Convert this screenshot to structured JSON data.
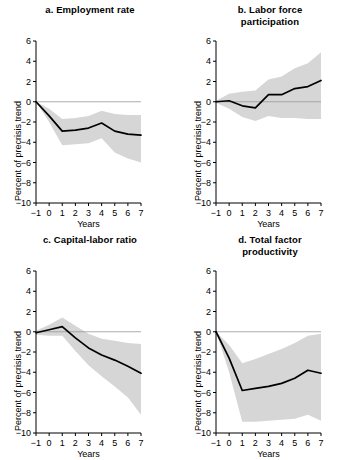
{
  "figure": {
    "background_color": "#ffffff",
    "band_color": "#d6d6d6",
    "line_color": "#000000",
    "axis_color": "#000000",
    "zeroline_color": "#999999"
  },
  "common": {
    "ylabel": "Percent of precrisis trend",
    "xlabel": "Years",
    "ylim": [
      -10,
      6
    ],
    "xlim": [
      -1,
      7
    ],
    "yticks": [
      "6",
      "4",
      "2",
      "0",
      "-2",
      "-4",
      "-6",
      "-8",
      "-10"
    ],
    "xticks": [
      "-1",
      "0",
      "1",
      "2",
      "3",
      "4",
      "5",
      "6",
      "7"
    ]
  },
  "chart_data": [
    {
      "type": "line",
      "panel": "a",
      "title": "a. Employment rate",
      "title_lines": [
        "a. Employment rate"
      ],
      "xlabel": "Years",
      "ylabel": "Percent of precrisis trend",
      "xlim": [
        -1,
        7
      ],
      "ylim": [
        -10,
        6
      ],
      "yticks": [
        6,
        4,
        2,
        0,
        -2,
        -4,
        -6,
        -8,
        -10
      ],
      "xticks": [
        -1,
        0,
        1,
        2,
        3,
        4,
        5,
        6,
        7
      ],
      "grid": false,
      "legend": "none",
      "x": [
        -1,
        0,
        1,
        2,
        3,
        4,
        5,
        6,
        7
      ],
      "series": [
        {
          "name": "point estimate",
          "values": [
            0.0,
            -1.4,
            -2.9,
            -2.8,
            -2.6,
            -2.1,
            -2.9,
            -3.2,
            -3.3
          ]
        },
        {
          "name": "confidence band upper",
          "values": [
            0.0,
            -0.7,
            -1.7,
            -1.6,
            -1.4,
            -0.9,
            -1.2,
            -1.3,
            -1.3
          ]
        },
        {
          "name": "confidence band lower",
          "values": [
            0.0,
            -2.0,
            -4.3,
            -4.2,
            -4.1,
            -3.6,
            -5.0,
            -5.6,
            -6.0
          ]
        }
      ]
    },
    {
      "type": "line",
      "panel": "b",
      "title": "b. Labor force participation",
      "title_lines": [
        "b. Labor force",
        "participation"
      ],
      "xlabel": "Years",
      "ylabel": "Percent of precrisis trend",
      "xlim": [
        -1,
        7
      ],
      "ylim": [
        -10,
        6
      ],
      "yticks": [
        6,
        4,
        2,
        0,
        -2,
        -4,
        -6,
        -8,
        -10
      ],
      "xticks": [
        -1,
        0,
        1,
        2,
        3,
        4,
        5,
        6,
        7
      ],
      "grid": false,
      "legend": "none",
      "x": [
        -1,
        0,
        1,
        2,
        3,
        4,
        5,
        6,
        7
      ],
      "series": [
        {
          "name": "point estimate",
          "values": [
            0.0,
            0.1,
            -0.4,
            -0.6,
            0.7,
            0.7,
            1.3,
            1.5,
            2.1
          ]
        },
        {
          "name": "confidence band upper",
          "values": [
            0.1,
            0.8,
            1.0,
            1.1,
            2.2,
            2.5,
            3.3,
            3.8,
            4.9
          ]
        },
        {
          "name": "confidence band lower",
          "values": [
            -0.1,
            -0.7,
            -1.5,
            -1.9,
            -1.4,
            -1.6,
            -1.6,
            -1.7,
            -1.7
          ]
        }
      ]
    },
    {
      "type": "line",
      "panel": "c",
      "title": "c. Capital-labor ratio",
      "title_lines": [
        "c. Capital-labor ratio"
      ],
      "xlabel": "Years",
      "ylabel": "Percent of precrisis trend",
      "xlim": [
        -1,
        7
      ],
      "ylim": [
        -10,
        6
      ],
      "yticks": [
        6,
        4,
        2,
        0,
        -2,
        -4,
        -6,
        -8,
        -10
      ],
      "xticks": [
        -1,
        0,
        1,
        2,
        3,
        4,
        5,
        6,
        7
      ],
      "grid": false,
      "legend": "none",
      "x": [
        -1,
        0,
        1,
        2,
        3,
        4,
        5,
        6,
        7
      ],
      "series": [
        {
          "name": "point estimate",
          "values": [
            -0.1,
            0.2,
            0.5,
            -0.6,
            -1.6,
            -2.3,
            -2.8,
            -3.4,
            -4.1
          ]
        },
        {
          "name": "confidence band upper",
          "values": [
            0.1,
            0.7,
            1.4,
            0.6,
            -0.2,
            -0.7,
            -0.9,
            -1.1,
            -1.2
          ]
        },
        {
          "name": "confidence band lower",
          "values": [
            -0.3,
            -0.4,
            -0.4,
            -1.9,
            -3.3,
            -4.4,
            -5.4,
            -6.5,
            -8.2
          ]
        }
      ]
    },
    {
      "type": "line",
      "panel": "d",
      "title": "d. Total factor productivity",
      "title_lines": [
        "d. Total factor",
        "productivity"
      ],
      "xlabel": "Years",
      "ylabel": "Percent of precrisis trend",
      "xlim": [
        -1,
        7
      ],
      "ylim": [
        -10,
        6
      ],
      "yticks": [
        6,
        4,
        2,
        0,
        -2,
        -4,
        -6,
        -8,
        -10
      ],
      "xticks": [
        -1,
        0,
        1,
        2,
        3,
        4,
        5,
        6,
        7
      ],
      "grid": false,
      "legend": "none",
      "x": [
        -1,
        0,
        1,
        2,
        3,
        4,
        5,
        6,
        7
      ],
      "series": [
        {
          "name": "point estimate",
          "values": [
            0.0,
            -2.6,
            -5.8,
            -5.6,
            -5.4,
            -5.1,
            -4.6,
            -3.8,
            -4.1
          ]
        },
        {
          "name": "confidence band upper",
          "values": [
            0.0,
            -1.3,
            -3.1,
            -2.7,
            -2.2,
            -1.7,
            -1.1,
            -0.4,
            -0.2
          ]
        },
        {
          "name": "confidence band lower",
          "values": [
            0.0,
            -4.0,
            -8.9,
            -8.9,
            -8.8,
            -8.7,
            -8.6,
            -8.2,
            -8.8
          ]
        }
      ]
    }
  ]
}
